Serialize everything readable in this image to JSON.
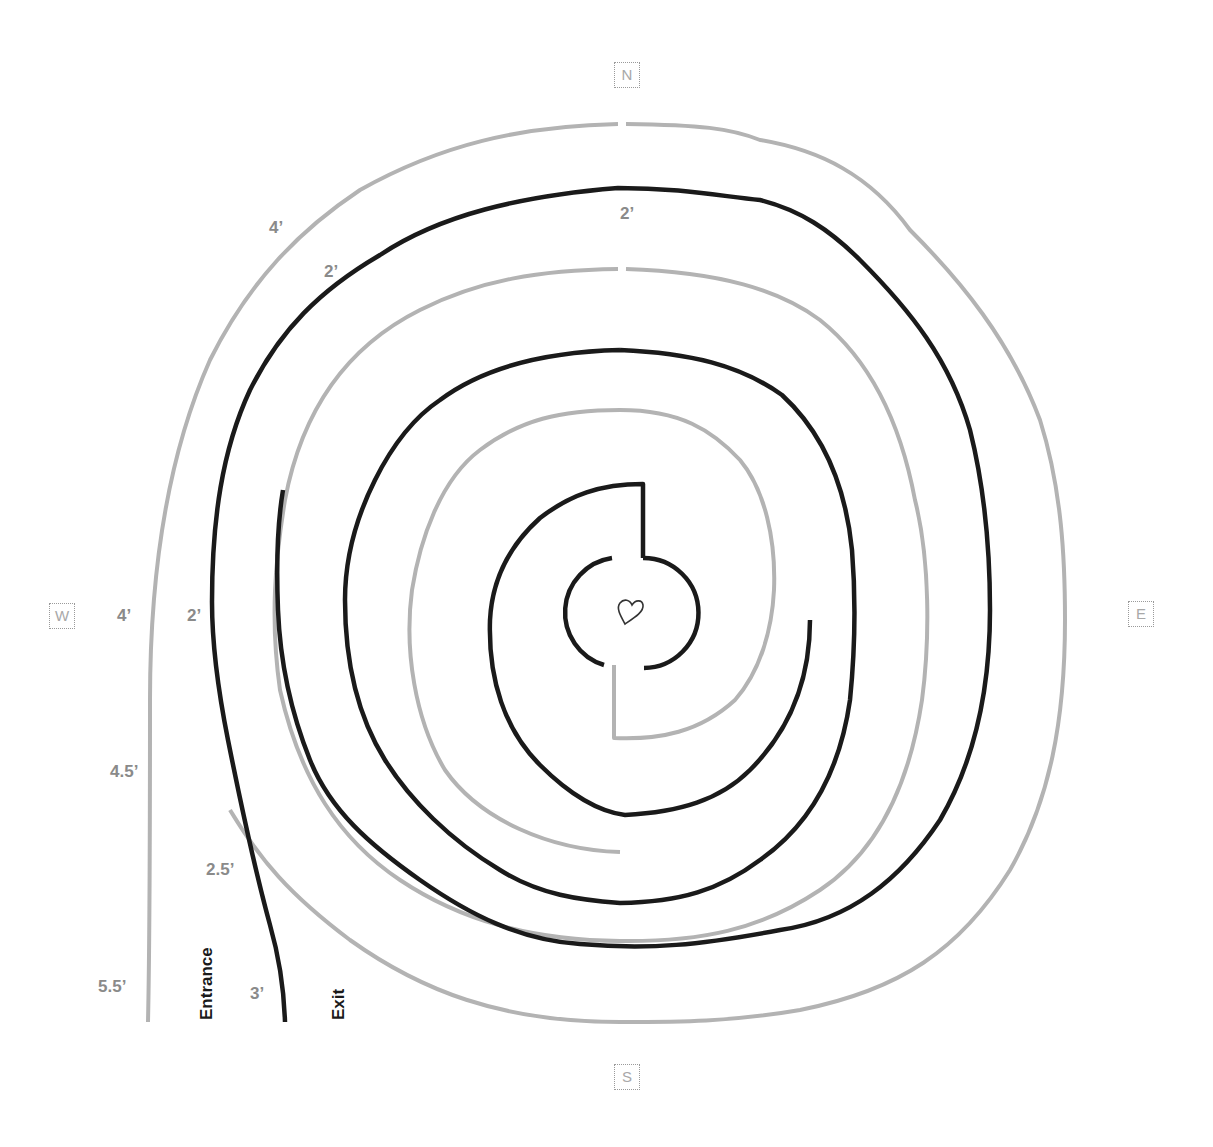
{
  "compass": {
    "north": "N",
    "south": "S",
    "east": "E",
    "west": "W"
  },
  "dimensions": {
    "outer_top_left": "4’",
    "inner_top_left": "2’",
    "top_center": "2’",
    "outer_west": "4’",
    "inner_west": "2’",
    "outer_southwest": "4.5’",
    "inner_southwest": "2.5’",
    "outer_bottom": "5.5’",
    "inner_bottom": "3’"
  },
  "labels": {
    "entrance": "Entrance",
    "exit": "Exit"
  },
  "center": {
    "icon": "heart-icon"
  },
  "colors": {
    "gray_wall": "#b3b3b3",
    "black_wall": "#1a1a1a",
    "compass_text": "#a8a8a8",
    "dimension_text": "#8a8a8a"
  }
}
